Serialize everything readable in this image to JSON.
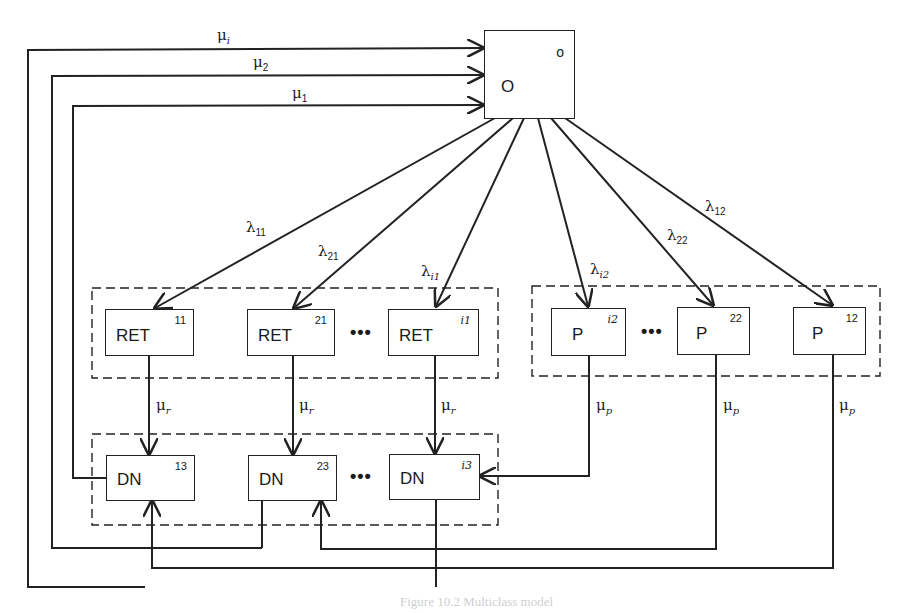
{
  "diagram": {
    "type": "queueing-network",
    "caption": "Figure 10.2 Multiclass model",
    "origin_node": {
      "name": "O",
      "superscript": "o"
    },
    "ret_group": [
      {
        "name": "RET",
        "superscript": "11"
      },
      {
        "name": "RET",
        "superscript": "21"
      },
      {
        "name": "RET",
        "superscript": "i1"
      }
    ],
    "p_group": [
      {
        "name": "P",
        "superscript": "i2"
      },
      {
        "name": "P",
        "superscript": "22"
      },
      {
        "name": "P",
        "superscript": "12"
      }
    ],
    "dn_group": [
      {
        "name": "DN",
        "superscript": "13"
      },
      {
        "name": "DN",
        "superscript": "23"
      },
      {
        "name": "DN",
        "superscript": "i3"
      }
    ],
    "ellipsis": "•••",
    "arrival_labels": [
      {
        "sym": "λ",
        "sub": "11"
      },
      {
        "sym": "λ",
        "sub": "21"
      },
      {
        "sym": "λ",
        "sub": "i1"
      },
      {
        "sym": "λ",
        "sub": "i2"
      },
      {
        "sym": "λ",
        "sub": "22"
      },
      {
        "sym": "λ",
        "sub": "12"
      }
    ],
    "return_labels": [
      {
        "sym": "μ",
        "sub": "i"
      },
      {
        "sym": "μ",
        "sub": "2"
      },
      {
        "sym": "μ",
        "sub": "1"
      }
    ],
    "service_labels": {
      "ret": [
        {
          "sym": "μ",
          "sub": "r"
        },
        {
          "sym": "μ",
          "sub": "r"
        },
        {
          "sym": "μ",
          "sub": "r"
        }
      ],
      "p": [
        {
          "sym": "μ",
          "sub": "p"
        },
        {
          "sym": "μ",
          "sub": "p"
        },
        {
          "sym": "μ",
          "sub": "p"
        }
      ]
    }
  }
}
